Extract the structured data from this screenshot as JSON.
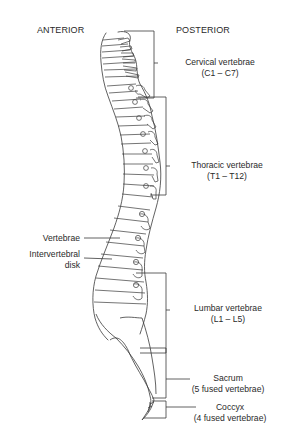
{
  "diagram": {
    "headers": {
      "anterior": "ANTERIOR",
      "posterior": "POSTERIOR"
    },
    "regions": [
      {
        "name": "Cervical vertebrae",
        "range": "(C1 – C7)"
      },
      {
        "name": "Thoracic vertebrae",
        "range": "(T1 – T12)"
      },
      {
        "name": "Lumbar vertebrae",
        "range": "(L1 – L5)"
      },
      {
        "name": "Sacrum",
        "range": "(5 fused vertebrae)"
      },
      {
        "name": "Coccyx",
        "range": "(4 fused vertebrae)"
      }
    ],
    "left_labels": {
      "vertebrae": "Vertebrae",
      "disk_line1": "Intervertebral",
      "disk_line2": "disk"
    },
    "colors": {
      "line": "#3a3a3a",
      "background": "#ffffff"
    }
  }
}
